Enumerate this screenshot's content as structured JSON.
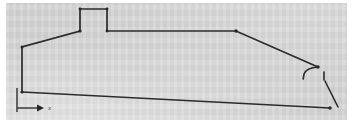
{
  "figure": {
    "kind": "scanned-line-drawing",
    "page_background": "#ffffff",
    "plate_background": "#d6d6d6",
    "stroke_color": "#2b2b2b",
    "axis_color": "#3a3a3a"
  },
  "annotations": {
    "x_axis_label": "x"
  },
  "chart_data": {
    "type": "line",
    "title": "",
    "subtitle": "",
    "xlabel": "x",
    "ylabel": "",
    "grid": false,
    "legend": null,
    "xlim": [
      0,
      353
    ],
    "ylim": [
      126,
      0
    ],
    "note": "Coordinates are image pixel coordinates; y increases downward.",
    "series": [
      {
        "name": "building-outline",
        "closed": false,
        "points": [
          [
            22,
            47
          ],
          [
            22,
            92
          ],
          [
            330,
            108
          ],
          [
            330,
            108
          ]
        ]
      },
      {
        "name": "roof-and-walls-profile",
        "closed": false,
        "points": [
          [
            22,
            92
          ],
          [
            22,
            47
          ],
          [
            80,
            31
          ],
          [
            80,
            9
          ],
          [
            107,
            9
          ],
          [
            107,
            31
          ],
          [
            236,
            31
          ],
          [
            318,
            67
          ]
        ]
      },
      {
        "name": "right-eave-hook",
        "closed": false,
        "points": [
          [
            318,
            67
          ],
          [
            312,
            68
          ],
          [
            307,
            70
          ],
          [
            304,
            74
          ],
          [
            303,
            79
          ]
        ]
      },
      {
        "name": "right-lower-edge",
        "closed": false,
        "points": [
          [
            324,
            72
          ],
          [
            324,
            80
          ],
          [
            337,
            107
          ]
        ]
      },
      {
        "name": "baseline",
        "closed": false,
        "points": [
          [
            22,
            92
          ],
          [
            330,
            108
          ]
        ]
      }
    ],
    "vertices": [
      [
        22,
        47
      ],
      [
        22,
        92
      ],
      [
        80,
        31
      ],
      [
        80,
        9
      ],
      [
        107,
        9
      ],
      [
        107,
        31
      ],
      [
        236,
        31
      ],
      [
        318,
        67
      ],
      [
        330,
        108
      ]
    ],
    "axis": {
      "name": "x-axis-arrow",
      "origin": [
        17,
        88
      ],
      "vertical_end": [
        17,
        112
      ],
      "arrow_start": [
        17,
        108
      ],
      "arrow_end": [
        44,
        108
      ],
      "label": "x",
      "label_position": [
        48,
        110
      ]
    }
  }
}
